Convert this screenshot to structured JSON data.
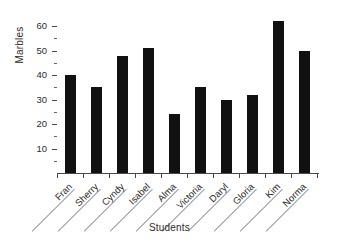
{
  "chart_data": {
    "type": "bar",
    "title": "",
    "xlabel": "Students",
    "ylabel": "Marbles",
    "categories": [
      "Fran",
      "Sherry",
      "Cyndy",
      "Isabel",
      "Alma",
      "Victoria",
      "Daryl",
      "Gloria",
      "Kim",
      "Norma"
    ],
    "values": [
      40,
      35,
      48,
      51,
      24,
      35,
      30,
      32,
      62,
      50
    ],
    "ylim": [
      0,
      65
    ],
    "ytick_major": [
      10,
      20,
      30,
      40,
      50,
      60
    ],
    "ytick_minor": [
      5,
      15,
      25,
      35,
      45,
      55
    ],
    "ytick_labels": [
      "10",
      "20",
      "30",
      "40",
      "50",
      "60"
    ],
    "grid": false,
    "legend": false,
    "bar_color": "#111111",
    "axis_color": "#4a4a4a",
    "text_color": "#2b2b2b",
    "background": "#ffffff",
    "xlabel_rotation": -45
  }
}
